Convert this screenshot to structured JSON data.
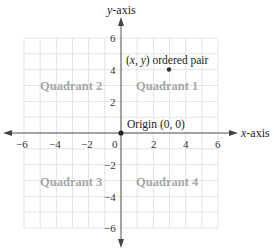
{
  "diagram": {
    "x_axis": {
      "label_var": "x",
      "label_rest": "-axis",
      "ticks": [
        {
          "value": -6,
          "label": "−6"
        },
        {
          "value": -4,
          "label": "−4"
        },
        {
          "value": -2,
          "label": "−2"
        },
        {
          "value": 0,
          "label": "0"
        },
        {
          "value": 2,
          "label": "2"
        },
        {
          "value": 4,
          "label": "4"
        },
        {
          "value": 6,
          "label": "6"
        }
      ]
    },
    "y_axis": {
      "label_var": "y",
      "label_rest": "-axis",
      "ticks": [
        {
          "value": 6,
          "label": "6"
        },
        {
          "value": 4,
          "label": "4"
        },
        {
          "value": 2,
          "label": "2"
        },
        {
          "value": -2,
          "label": "−2"
        },
        {
          "value": -4,
          "label": "−4"
        },
        {
          "value": -6,
          "label": "−6"
        }
      ]
    },
    "range": {
      "xmin": -6,
      "xmax": 6,
      "ymin": -6,
      "ymax": 6
    },
    "grid": {
      "step": 1,
      "color": "#e3e3e3"
    },
    "quadrants": [
      {
        "id": 1,
        "label": "Quadrant 1"
      },
      {
        "id": 2,
        "label": "Quadrant 2"
      },
      {
        "id": 3,
        "label": "Quadrant 3"
      },
      {
        "id": 4,
        "label": "Quadrant 4"
      }
    ],
    "points": [
      {
        "name": "ordered-pair",
        "x": 3,
        "y": 4,
        "label_prefix": "(",
        "label_x": "x",
        "label_sep": ", ",
        "label_y": "y",
        "label_suffix": ") ordered pair"
      },
      {
        "name": "origin",
        "x": 0,
        "y": 0,
        "label": "Origin (0, 0)"
      }
    ],
    "colors": {
      "axis": "#555555",
      "point": "#333333",
      "quadrant_text": "#a6a6a6",
      "grid": "#e3e3e3"
    }
  }
}
